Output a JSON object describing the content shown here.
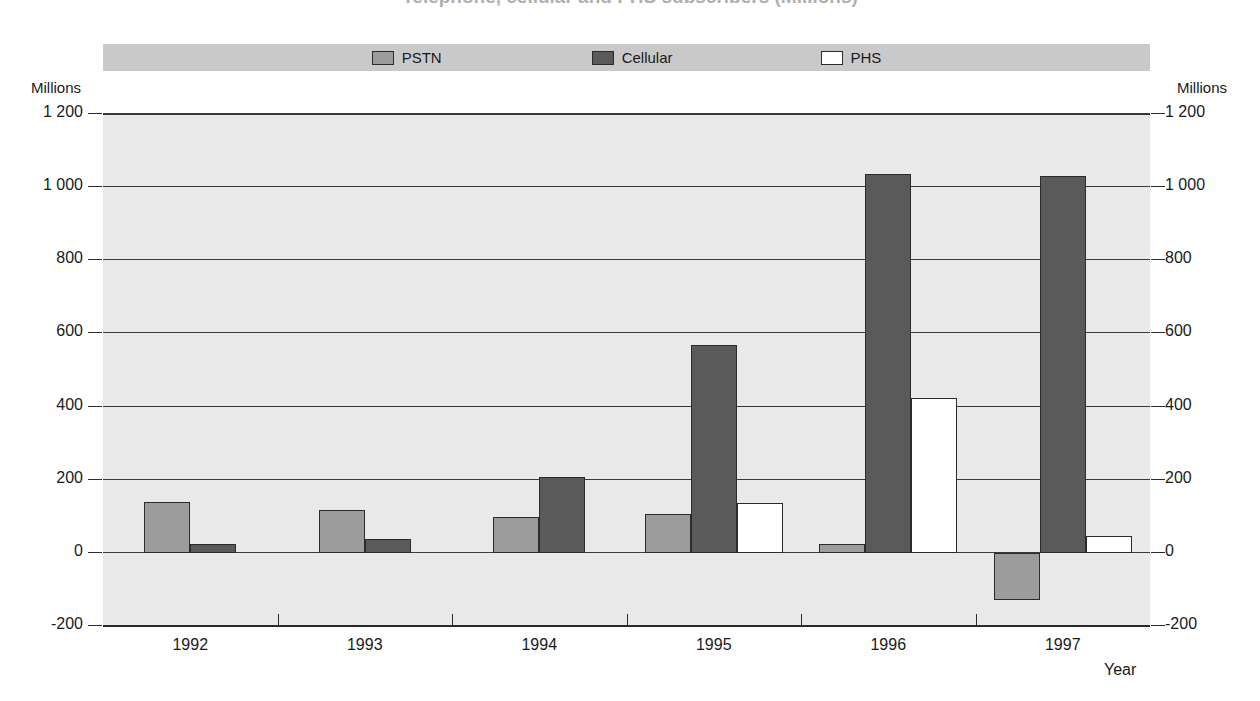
{
  "title": "Telephone, cellular and PHS subscribers (Millions)",
  "legend": {
    "items": [
      {
        "label": "PSTN",
        "color": "#9c9c9c",
        "icon": "legend-swatch-icon"
      },
      {
        "label": "Cellular",
        "color": "#5a5a5a",
        "icon": "legend-swatch-icon"
      },
      {
        "label": "PHS",
        "color": "#ffffff",
        "icon": "legend-swatch-icon"
      }
    ]
  },
  "axes": {
    "left_unit": "Millions",
    "right_unit": "Millions",
    "x_title": "Year",
    "y_ticks": [
      "1 200",
      "1 000",
      "800",
      "600",
      "400",
      "200",
      "0",
      "-200"
    ],
    "x_ticks": [
      "1992",
      "1993",
      "1994",
      "1995",
      "1996",
      "1997"
    ]
  },
  "chart_data": {
    "type": "bar",
    "title": "Telephone, cellular and PHS subscribers (Millions)",
    "xlabel": "Year",
    "ylabel": "Millions",
    "ylim": [
      -200,
      1200
    ],
    "ytick_step": 200,
    "grid": true,
    "legend_position": "top-center",
    "categories": [
      "1992",
      "1993",
      "1994",
      "1995",
      "1996",
      "1997"
    ],
    "series": [
      {
        "name": "PSTN",
        "color": "#9c9c9c",
        "values": [
          140,
          116,
          97,
          105,
          24,
          -130
        ]
      },
      {
        "name": "Cellular",
        "color": "#5a5a5a",
        "values": [
          24,
          38,
          208,
          567,
          1035,
          1030
        ]
      },
      {
        "name": "PHS",
        "color": "#ffffff",
        "values": [
          null,
          null,
          null,
          135,
          424,
          46
        ]
      }
    ]
  }
}
